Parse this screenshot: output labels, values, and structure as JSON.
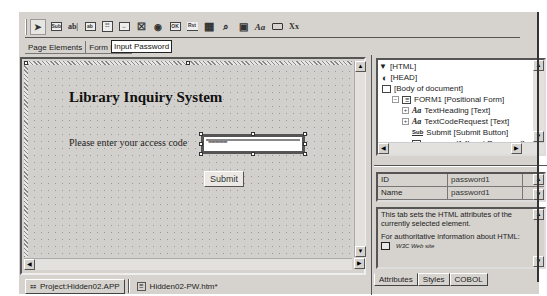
{
  "toolbar": {
    "tools": [
      {
        "name": "pointer-tool",
        "glyph": "➤"
      },
      {
        "name": "submit-tool",
        "glyph": "Sub"
      },
      {
        "name": "text-tool",
        "glyph": "ab|"
      },
      {
        "name": "input-tool",
        "glyph": "▭"
      },
      {
        "name": "listbox-tool",
        "glyph": "☷"
      },
      {
        "name": "input-password-tool",
        "glyph": "↔"
      },
      {
        "name": "checkbox-tool",
        "glyph": "☒"
      },
      {
        "name": "radio-tool",
        "glyph": "◉"
      },
      {
        "name": "ok-button-tool",
        "glyph": "OK"
      },
      {
        "name": "reset-tool",
        "glyph": "Rst"
      },
      {
        "name": "image-tool",
        "glyph": "▦"
      },
      {
        "name": "find-tool",
        "glyph": "⌕"
      },
      {
        "name": "frame-tool",
        "glyph": "▣"
      },
      {
        "name": "text-style-tool",
        "glyph": "Aa"
      },
      {
        "name": "box-tool",
        "glyph": "▭"
      },
      {
        "name": "hidden-tool",
        "glyph": "Xx"
      }
    ]
  },
  "palette_tabs": [
    "Page Elements",
    "Form Elem"
  ],
  "tooltip": "Input Password",
  "designer": {
    "heading": "Library Inquiry System",
    "prompt_label": "Please enter your access code",
    "password_mask": "**************",
    "submit_label": "Submit"
  },
  "bottom_tabs": [
    {
      "label": "Project:Hidden02.APP",
      "active": true
    },
    {
      "label": "Hidden02-PW.htm*",
      "active": false
    }
  ],
  "tree": {
    "items": [
      {
        "label": "[HTML]",
        "indent": 0
      },
      {
        "label": "[HEAD]",
        "indent": 1
      },
      {
        "label": "[Body of document]",
        "indent": 1
      },
      {
        "label": "FORM1 [Positional Form]",
        "indent": 2
      },
      {
        "label": "TextHeading [Text]",
        "indent": 3
      },
      {
        "label": "TextCodeRequest [Text]",
        "indent": 3
      },
      {
        "label": "Submit [Submit Button]",
        "indent": 3
      },
      {
        "label": "password1 [Input Password]",
        "indent": 3
      }
    ]
  },
  "properties": [
    {
      "key": "ID",
      "value": "password1"
    },
    {
      "key": "Name",
      "value": "password1"
    }
  ],
  "help": {
    "line1": "This tab sets the HTML attributes of the currently selected element.",
    "line2": "For authoritative information about HTML:",
    "link": "W3C Web site"
  },
  "right_tabs": [
    "Attributes",
    "Styles",
    "COBOL"
  ]
}
